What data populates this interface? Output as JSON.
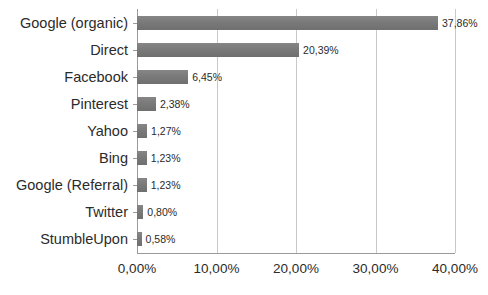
{
  "chart_data": {
    "type": "bar",
    "orientation": "horizontal",
    "title": "",
    "subtitle": "",
    "xlabel": "",
    "ylabel": "",
    "categories": [
      "Google (organic)",
      "Direct",
      "Facebook",
      "Pinterest",
      "Yahoo",
      "Bing",
      "Google (Referral)",
      "Twitter",
      "StumbleUpon"
    ],
    "values": [
      37.86,
      20.39,
      6.45,
      2.38,
      1.27,
      1.23,
      1.23,
      0.8,
      0.58
    ],
    "data_labels": [
      "37,86%",
      "20,39%",
      "6,45%",
      "2,38%",
      "1,27%",
      "1,23%",
      "1,23%",
      "0,80%",
      "0,58%"
    ],
    "xlim": [
      0,
      40
    ],
    "x_ticks": [
      0,
      10,
      20,
      30,
      40
    ],
    "x_tick_labels": [
      "0,00%",
      "10,00%",
      "20,00%",
      "30,00%",
      "40,00%"
    ],
    "grid": "vertical",
    "legend": "none",
    "bar_color": "#7a7a7a",
    "gridline_color": "#c9c9c9",
    "axis_color": "#9a9a9a",
    "text_color": "#2b2b2b",
    "background_color": "#ffffff"
  }
}
